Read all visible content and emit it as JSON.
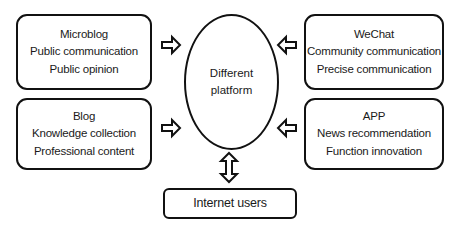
{
  "diagram": {
    "center": {
      "shape": "ellipse",
      "lines": [
        "Different",
        "platform"
      ]
    },
    "platforms": [
      {
        "id": "microblog",
        "position": "top-left",
        "lines": [
          "Microblog",
          "Public communication",
          "Public opinion"
        ]
      },
      {
        "id": "blog",
        "position": "bottom-left",
        "lines": [
          "Blog",
          "Knowledge collection",
          "Professional content"
        ]
      },
      {
        "id": "wechat",
        "position": "top-right",
        "lines": [
          "WeChat",
          "Community communication",
          "Precise communication"
        ]
      },
      {
        "id": "app",
        "position": "bottom-right",
        "lines": [
          "APP",
          "News recommendation",
          "Function innovation"
        ]
      }
    ],
    "users": {
      "label": "Internet users"
    },
    "connections": [
      {
        "from": "microblog",
        "to": "center",
        "arrow": "hollow-right"
      },
      {
        "from": "blog",
        "to": "center",
        "arrow": "hollow-right"
      },
      {
        "from": "wechat",
        "to": "center",
        "arrow": "hollow-left"
      },
      {
        "from": "app",
        "to": "center",
        "arrow": "hollow-left"
      },
      {
        "from": "center",
        "to": "users",
        "arrow": "hollow-double-vertical"
      }
    ],
    "colors": {
      "stroke": "#111111",
      "fill": "#ffffff",
      "text": "#1a1a1a"
    }
  }
}
